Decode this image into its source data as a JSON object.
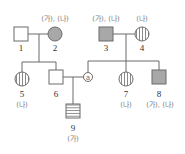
{
  "diagram": {
    "type": "pedigree",
    "colors": {
      "line": "#6b6b6b",
      "affected_fill": "#a8a8a8",
      "unaffected_fill": "#ffffff"
    },
    "legend_notes": {
      "solid_gray": "expresses (가) and (나)",
      "vertical_stripes": "expresses (나) only",
      "horizontal_stripes": "expresses (가) only"
    },
    "individuals": [
      {
        "id": "1",
        "sex": "male",
        "traits": "",
        "pattern": "none"
      },
      {
        "id": "2",
        "sex": "female",
        "traits": "(가), (나)",
        "pattern": "solid"
      },
      {
        "id": "3",
        "sex": "male",
        "traits": "(가), (나)",
        "pattern": "solid"
      },
      {
        "id": "4",
        "sex": "female",
        "traits": "(나)",
        "pattern": "vertical"
      },
      {
        "id": "5",
        "sex": "female",
        "traits": "(나)",
        "pattern": "vertical"
      },
      {
        "id": "6",
        "sex": "male",
        "traits": "",
        "pattern": "none"
      },
      {
        "id": "7",
        "sex": "female",
        "traits": "(나)",
        "pattern": "vertical"
      },
      {
        "id": "8",
        "sex": "male",
        "traits": "(가), (나)",
        "pattern": "solid"
      },
      {
        "id": "9",
        "sex": "male",
        "traits": "(가)",
        "pattern": "horizontal"
      }
    ],
    "marker": {
      "label": "a",
      "note": "unknown individual ⓐ, child of 3 and 4, mate of 6"
    }
  }
}
